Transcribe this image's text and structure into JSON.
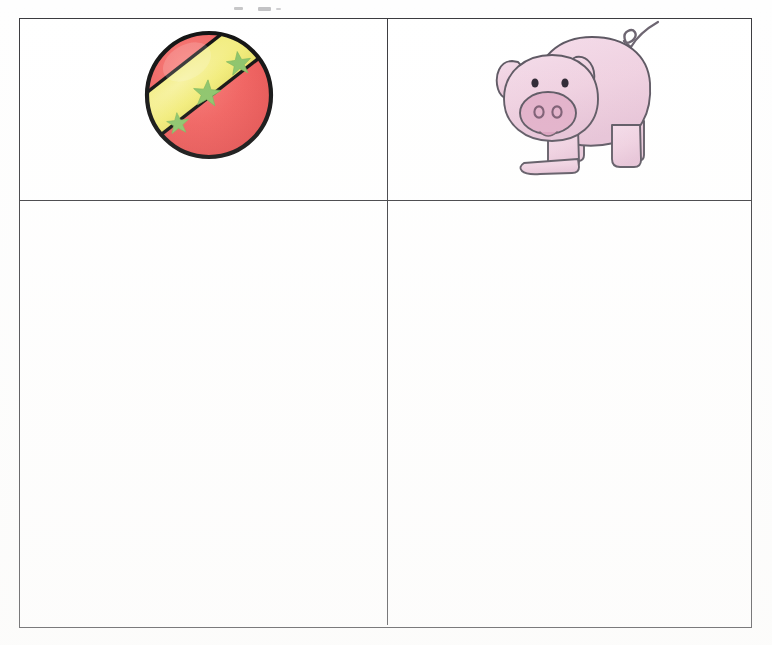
{
  "page": {
    "kind": "scanned-worksheet-page",
    "background_color": "#fefefe",
    "width": 772,
    "height": 645
  },
  "table": {
    "border_color": "#3a3a3e",
    "rows": 2,
    "columns": 2,
    "cells": [
      {
        "id": "cell-r1c1",
        "row": 1,
        "column": 1,
        "content_type": "image",
        "image_name": "striped-ball",
        "label": "ball",
        "text": ""
      },
      {
        "id": "cell-r1c2",
        "row": 1,
        "column": 2,
        "content_type": "image",
        "image_name": "pig",
        "label": "pig",
        "text": ""
      },
      {
        "id": "cell-r2c1",
        "row": 2,
        "column": 1,
        "content_type": "blank",
        "image_name": "",
        "label": "blank answer area",
        "text": ""
      },
      {
        "id": "cell-r2c2",
        "row": 2,
        "column": 2,
        "content_type": "blank",
        "image_name": "",
        "label": "blank answer area",
        "text": ""
      }
    ]
  },
  "illustrations": {
    "ball": {
      "name": "striped-ball",
      "outline_color": "#111111",
      "body_color": "#f0605e",
      "band_color": "#f2ec7a",
      "star_color": "#8cc46a",
      "star_count": 3,
      "diameter_px": 128
    },
    "pig": {
      "name": "pig",
      "outline_color": "#5b5560",
      "body_color": "#efd0e0",
      "snout_color": "#e2b0c9",
      "eye_color": "#2a2430",
      "tail_color": "#6b636f",
      "leg_count": 4,
      "ear_count": 2
    }
  },
  "top_remnant": {
    "description": "faint cropped ink from the line of text above the table",
    "visible": true
  }
}
